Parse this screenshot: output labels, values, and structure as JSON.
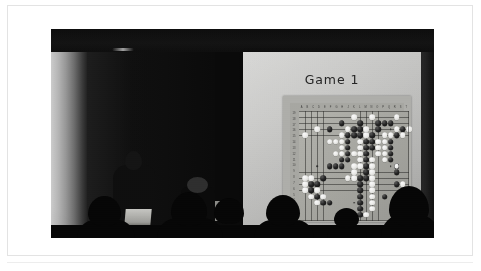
{
  "photo": {
    "caption_title": "Game 1",
    "scene": "lecture-hall-go-game-presentation",
    "colors": {
      "page_background": "#ffffff",
      "room_dark": "#060606",
      "screen_light": "#d0d0ce",
      "board_wood": "#a9a9a4",
      "stone_black": "#0f0f0f",
      "stone_white": "#f4f4f1",
      "silhouette": "#020202"
    }
  },
  "slide": {
    "title": "Game 1"
  },
  "goboard": {
    "size": 19,
    "column_labels": [
      "A",
      "B",
      "C",
      "D",
      "E",
      "F",
      "G",
      "H",
      "J",
      "K",
      "L",
      "M",
      "N",
      "O",
      "P",
      "Q",
      "R",
      "S",
      "T"
    ],
    "row_labels": [
      "19",
      "18",
      "17",
      "16",
      "15",
      "14",
      "13",
      "12",
      "11",
      "10",
      "9",
      "8",
      "7",
      "6",
      "5",
      "4",
      "3",
      "2",
      "1"
    ],
    "star_points": [
      [
        3,
        3
      ],
      [
        9,
        3
      ],
      [
        15,
        3
      ],
      [
        3,
        9
      ],
      [
        9,
        9
      ],
      [
        15,
        9
      ],
      [
        3,
        15
      ],
      [
        9,
        15
      ],
      [
        15,
        15
      ]
    ],
    "black_stones": [
      [
        7,
        2
      ],
      [
        10,
        2
      ],
      [
        13,
        2
      ],
      [
        14,
        2
      ],
      [
        15,
        2
      ],
      [
        5,
        3
      ],
      [
        9,
        3
      ],
      [
        10,
        3
      ],
      [
        13,
        3
      ],
      [
        17,
        3
      ],
      [
        8,
        4
      ],
      [
        9,
        4
      ],
      [
        10,
        4
      ],
      [
        12,
        4
      ],
      [
        16,
        4
      ],
      [
        8,
        5
      ],
      [
        11,
        5
      ],
      [
        12,
        5
      ],
      [
        15,
        5
      ],
      [
        8,
        6
      ],
      [
        11,
        6
      ],
      [
        12,
        6
      ],
      [
        15,
        6
      ],
      [
        8,
        7
      ],
      [
        11,
        7
      ],
      [
        15,
        7
      ],
      [
        7,
        8
      ],
      [
        8,
        8
      ],
      [
        11,
        8
      ],
      [
        15,
        8
      ],
      [
        5,
        9
      ],
      [
        6,
        9
      ],
      [
        7,
        9
      ],
      [
        11,
        9
      ],
      [
        11,
        10
      ],
      [
        16,
        10
      ],
      [
        4,
        11
      ],
      [
        10,
        11
      ],
      [
        11,
        11
      ],
      [
        2,
        12
      ],
      [
        3,
        12
      ],
      [
        10,
        12
      ],
      [
        16,
        12
      ],
      [
        2,
        13
      ],
      [
        10,
        13
      ],
      [
        3,
        14
      ],
      [
        10,
        14
      ],
      [
        14,
        14
      ],
      [
        4,
        15
      ],
      [
        5,
        15
      ],
      [
        10,
        15
      ],
      [
        10,
        16
      ],
      [
        17,
        16
      ],
      [
        8,
        17
      ],
      [
        10,
        17
      ],
      [
        9,
        17
      ]
    ],
    "white_stones": [
      [
        9,
        1
      ],
      [
        12,
        1
      ],
      [
        16,
        1
      ],
      [
        3,
        3
      ],
      [
        8,
        3
      ],
      [
        11,
        3
      ],
      [
        16,
        3
      ],
      [
        18,
        3
      ],
      [
        1,
        4
      ],
      [
        7,
        4
      ],
      [
        11,
        4
      ],
      [
        14,
        4
      ],
      [
        15,
        4
      ],
      [
        17,
        4
      ],
      [
        5,
        5
      ],
      [
        6,
        5
      ],
      [
        7,
        5
      ],
      [
        10,
        5
      ],
      [
        13,
        5
      ],
      [
        14,
        5
      ],
      [
        7,
        6
      ],
      [
        10,
        6
      ],
      [
        13,
        6
      ],
      [
        14,
        6
      ],
      [
        6,
        7
      ],
      [
        7,
        7
      ],
      [
        10,
        7
      ],
      [
        13,
        7
      ],
      [
        14,
        7
      ],
      [
        9,
        7
      ],
      [
        10,
        8
      ],
      [
        12,
        8
      ],
      [
        14,
        8
      ],
      [
        9,
        9
      ],
      [
        10,
        9
      ],
      [
        12,
        9
      ],
      [
        16,
        9
      ],
      [
        9,
        10
      ],
      [
        12,
        10
      ],
      [
        1,
        11
      ],
      [
        2,
        11
      ],
      [
        8,
        11
      ],
      [
        9,
        11
      ],
      [
        12,
        11
      ],
      [
        1,
        12
      ],
      [
        12,
        12
      ],
      [
        17,
        12
      ],
      [
        1,
        13
      ],
      [
        3,
        13
      ],
      [
        12,
        13
      ],
      [
        2,
        14
      ],
      [
        4,
        14
      ],
      [
        12,
        14
      ],
      [
        17,
        14
      ],
      [
        3,
        15
      ],
      [
        12,
        15
      ],
      [
        12,
        16
      ],
      [
        9,
        17
      ],
      [
        11,
        17
      ]
    ],
    "last_move_marker": {
      "coord": [
        16,
        9
      ],
      "color": "white"
    }
  }
}
